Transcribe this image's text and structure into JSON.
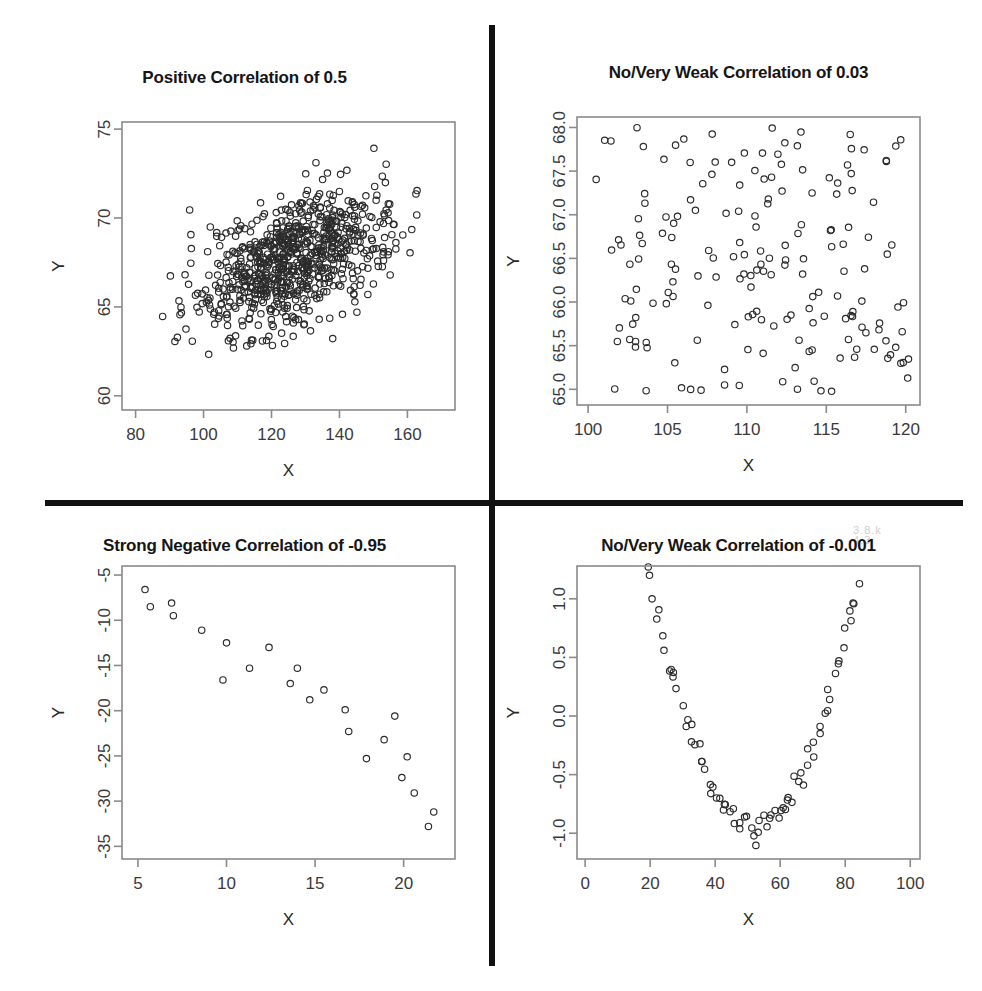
{
  "figure": {
    "background_color": "#ffffff",
    "divider_color": "#111111",
    "point_color": "#2b2b2b",
    "axis_color": "#8a8a8a",
    "layout": "2x2 grid of scatterplots separated by a thick black cross",
    "smudge_text": "3.8.k"
  },
  "chart_data": [
    {
      "id": "positive-correlation",
      "type": "scatter",
      "title": "Positive Correlation of 0.5",
      "xlabel": "X",
      "ylabel": "Y",
      "correlation": 0.5,
      "n_points": 800,
      "xlim": [
        76,
        174
      ],
      "ylim": [
        59.2,
        75.4
      ],
      "xticks": [
        80,
        100,
        120,
        140,
        160
      ],
      "yticks": [
        60,
        65,
        70,
        75
      ],
      "grid": false,
      "legend": "none",
      "marker": "open-circle",
      "distribution": {
        "kind": "bivariate-normal",
        "x_mean": 127,
        "x_sd": 14,
        "y_mean": 67.6,
        "y_sd": 1.9,
        "rho": 0.5
      }
    },
    {
      "id": "no-correlation-positive",
      "type": "scatter",
      "title": "No/Very Weak Correlation of 0.03",
      "xlabel": "X",
      "ylabel": "Y",
      "correlation": 0.03,
      "n_points": 180,
      "xlim": [
        99.3,
        120.9
      ],
      "ylim": [
        64.82,
        68.12
      ],
      "xticks": [
        100,
        105,
        110,
        115,
        120
      ],
      "yticks": [
        65.0,
        65.5,
        66.0,
        66.5,
        67.0,
        67.5,
        68.0
      ],
      "ytick_labels": [
        "65.0",
        "65.5",
        "66.0",
        "66.5",
        "67.0",
        "67.5",
        "68.0"
      ],
      "grid": false,
      "legend": "none",
      "marker": "open-circle",
      "distribution": {
        "kind": "uniform-scatter",
        "x_min": 100,
        "x_max": 120.5,
        "y_min": 64.95,
        "y_max": 68.0,
        "rho": 0.03
      }
    },
    {
      "id": "strong-negative-correlation",
      "type": "scatter",
      "title": "Strong Negative Correlation of -0.95",
      "xlabel": "X",
      "ylabel": "Y",
      "correlation": -0.95,
      "n_points": 30,
      "xlim": [
        4.1,
        22.9
      ],
      "ylim": [
        -36.4,
        -4.0
      ],
      "xticks": [
        5,
        10,
        15,
        20
      ],
      "yticks": [
        -35,
        -30,
        -25,
        -20,
        -15,
        -10,
        -5
      ],
      "grid": false,
      "legend": "none",
      "marker": "open-circle",
      "points": [
        [
          5.4,
          -6.6
        ],
        [
          5.7,
          -8.5
        ],
        [
          6.9,
          -8.1
        ],
        [
          7.0,
          -9.5
        ],
        [
          8.6,
          -11.1
        ],
        [
          10.0,
          -12.5
        ],
        [
          12.4,
          -13.0
        ],
        [
          9.8,
          -16.6
        ],
        [
          11.3,
          -15.3
        ],
        [
          14.0,
          -15.3
        ],
        [
          13.6,
          -17.0
        ],
        [
          15.5,
          -17.7
        ],
        [
          14.7,
          -18.8
        ],
        [
          16.7,
          -19.9
        ],
        [
          19.5,
          -20.6
        ],
        [
          16.9,
          -22.3
        ],
        [
          18.9,
          -23.2
        ],
        [
          20.2,
          -25.1
        ],
        [
          17.9,
          -25.3
        ],
        [
          19.9,
          -27.4
        ],
        [
          20.6,
          -29.1
        ],
        [
          21.7,
          -31.2
        ],
        [
          21.4,
          -32.8
        ]
      ]
    },
    {
      "id": "no-correlation-quadratic",
      "type": "scatter",
      "title": "No/Very Weak Correlation of -0.001",
      "xlabel": "X",
      "ylabel": "Y",
      "correlation": -0.001,
      "n_points": 120,
      "xlim": [
        -2.5,
        103
      ],
      "ylim": [
        -1.22,
        1.28
      ],
      "xticks": [
        0,
        20,
        40,
        60,
        80,
        100
      ],
      "yticks": [
        -1.0,
        -0.5,
        0.0,
        0.5,
        1.0
      ],
      "ytick_labels": [
        "-1.0",
        "-0.5",
        "0.0",
        "0.5",
        "1.0"
      ],
      "grid": false,
      "legend": "none",
      "marker": "open-circle",
      "distribution": {
        "kind": "u-shaped-quadratic",
        "vertex_x": 52,
        "vertex_y": -0.95,
        "curvature": 0.00082,
        "noise_sd": 0.07
      }
    }
  ]
}
